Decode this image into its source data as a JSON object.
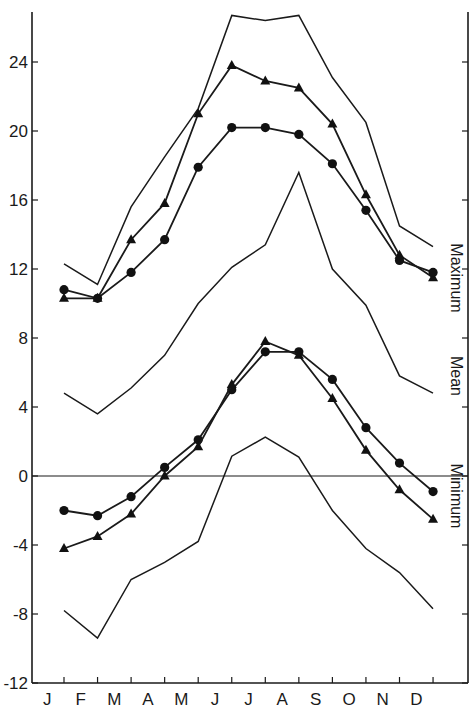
{
  "chart_data": {
    "type": "line",
    "title": "",
    "xlabel": "",
    "ylabel": "",
    "ylim": [
      -12,
      26.9
    ],
    "grid": false,
    "categories": [
      "J",
      "F",
      "M",
      "A",
      "M",
      "J",
      "J",
      "A",
      "S",
      "O",
      "N",
      "D"
    ],
    "yticks": [
      24,
      20,
      16,
      12,
      8,
      4,
      0,
      -4,
      -8,
      -12
    ],
    "ytick_labels": [
      "24",
      "20",
      "16",
      "12",
      "8",
      "4",
      "0",
      "-4",
      "-8",
      "-12"
    ],
    "reference_line": 0,
    "group_labels": [
      "Maximum",
      "Mean",
      "Minimum"
    ],
    "series": [
      {
        "name": "Extreme maximum",
        "group": "Maximum",
        "marker": "none",
        "values": [
          12.3,
          11.1,
          15.6,
          18.5,
          21.3,
          26.7,
          26.4,
          26.7,
          23.1,
          20.5,
          14.5,
          13.3
        ]
      },
      {
        "name": "Maximum (triangles)",
        "group": "Maximum",
        "marker": "triangle",
        "values": [
          10.3,
          10.3,
          13.7,
          15.8,
          21.0,
          23.8,
          22.9,
          22.5,
          20.4,
          16.3,
          12.8,
          11.5
        ]
      },
      {
        "name": "Maximum (circles)",
        "group": "Maximum",
        "marker": "circle",
        "values": [
          10.8,
          10.3,
          11.8,
          13.7,
          17.9,
          20.2,
          20.2,
          19.8,
          18.1,
          15.4,
          12.5,
          11.8
        ]
      },
      {
        "name": "Mean",
        "group": "Mean",
        "marker": "none",
        "values": [
          4.8,
          3.6,
          5.1,
          7.0,
          10.0,
          12.1,
          13.4,
          17.6,
          12.0,
          9.9,
          5.8,
          4.8
        ]
      },
      {
        "name": "Minimum (circles)",
        "group": "Minimum",
        "marker": "circle",
        "values": [
          -2.0,
          -2.3,
          -1.2,
          0.5,
          2.1,
          5.0,
          7.2,
          7.2,
          5.6,
          2.8,
          0.75,
          -0.9
        ]
      },
      {
        "name": "Minimum (triangles)",
        "group": "Minimum",
        "marker": "triangle",
        "values": [
          -4.2,
          -3.5,
          -2.2,
          0.0,
          1.7,
          5.3,
          7.8,
          7.0,
          4.5,
          1.5,
          -0.8,
          -2.5
        ]
      },
      {
        "name": "Extreme minimum",
        "group": "Minimum",
        "marker": "none",
        "values": [
          -7.8,
          -9.4,
          -6.0,
          -5.0,
          -3.8,
          1.15,
          2.25,
          1.1,
          -2.0,
          -4.2,
          -5.6,
          -7.7
        ]
      }
    ]
  },
  "layout": {
    "plot_left": 32,
    "plot_right": 468,
    "plot_top": 12,
    "axis_bottom": 683,
    "y_zero_px": 476,
    "px_per_unit": 17.25,
    "first_point_x": 64,
    "point_spacing": 33.55,
    "side_label_positions": {
      "Maximum": 278,
      "Mean": 376,
      "Minimum": 496
    }
  }
}
